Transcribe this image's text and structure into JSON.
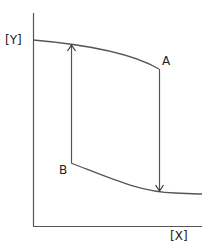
{
  "diagram": {
    "axes": {
      "y_label": "[Y]",
      "x_label": "[X]"
    },
    "points": {
      "a": "A",
      "b": "B"
    },
    "curves": [
      {
        "name": "upper-curve",
        "description": "gently decreasing curve from Y axis to point A"
      },
      {
        "name": "lower-curve",
        "description": "decreasing curve from point B flattening to the right"
      }
    ],
    "arrows": [
      {
        "name": "arrow-b-to-upper",
        "direction": "up",
        "from": "B",
        "to": "upper curve"
      },
      {
        "name": "arrow-a-to-lower",
        "direction": "down",
        "from": "A",
        "to": "lower curve"
      }
    ],
    "colors": {
      "line": "#555555",
      "text": "#222222",
      "background": "#ffffff"
    }
  }
}
